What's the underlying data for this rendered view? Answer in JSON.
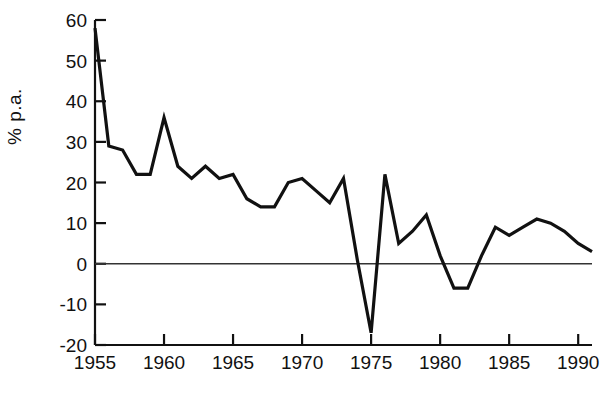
{
  "chart_data": {
    "type": "line",
    "title": "",
    "xlabel": "",
    "ylabel": "% p.a.",
    "xlim": [
      1954.6,
      1991.4
    ],
    "ylim": [
      -20,
      60
    ],
    "grid": false,
    "legend": null,
    "zero_line": 0,
    "ytick_labels": [
      "60",
      "50",
      "40",
      "30",
      "20",
      "10",
      "0",
      "-10",
      "-20"
    ],
    "yticks": [
      60,
      50,
      40,
      30,
      20,
      10,
      0,
      -10,
      -20
    ],
    "xtick_labels": [
      "1955",
      "1960",
      "1965",
      "1970",
      "1975",
      "1980",
      "1985",
      "1990"
    ],
    "xticks": [
      1955,
      1960,
      1965,
      1970,
      1975,
      1980,
      1985,
      1990
    ],
    "x": [
      1955,
      1956,
      1957,
      1958,
      1959,
      1960,
      1961,
      1962,
      1963,
      1964,
      1965,
      1966,
      1967,
      1968,
      1969,
      1970,
      1971,
      1972,
      1973,
      1974,
      1975,
      1976,
      1977,
      1978,
      1979,
      1980,
      1981,
      1982,
      1983,
      1984,
      1985,
      1986,
      1987,
      1988,
      1989,
      1990,
      1991
    ],
    "values": [
      58,
      29,
      28,
      22,
      22,
      36,
      24,
      21,
      24,
      21,
      22,
      16,
      14,
      14,
      20,
      21,
      18,
      15,
      21,
      1,
      -17,
      22,
      5,
      8,
      12,
      2,
      -6,
      -6,
      2,
      9,
      7,
      9,
      11,
      10,
      8,
      5,
      3
    ],
    "series": [
      {
        "name": "% p.a.",
        "color": "#111111",
        "linewidth": 3.2,
        "values": [
          58,
          29,
          28,
          22,
          22,
          36,
          24,
          21,
          24,
          21,
          22,
          16,
          14,
          14,
          20,
          21,
          18,
          15,
          21,
          1,
          -17,
          22,
          5,
          8,
          12,
          2,
          -6,
          -6,
          2,
          9,
          7,
          9,
          11,
          10,
          8,
          5,
          3
        ]
      }
    ],
    "axis_color": "#111111",
    "background_color": "#ffffff"
  }
}
